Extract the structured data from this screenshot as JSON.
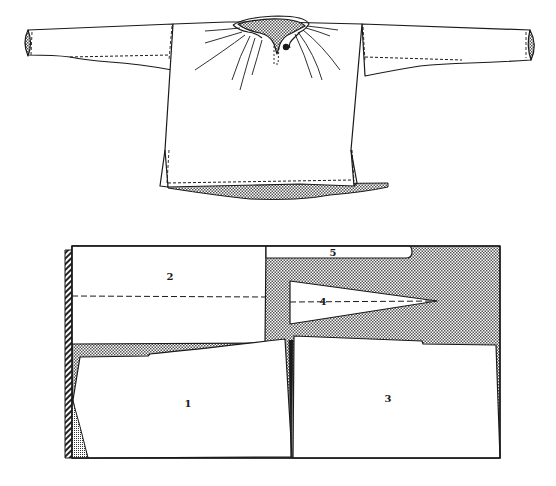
{
  "figure": {
    "type": "garment-pattern-illustration",
    "shirt_illustration": {
      "description": "Long-sleeved tunic shirt with gathered neckline and keyhole slit, side vents, dashed stitching lines",
      "features": [
        "gathered-neckline",
        "neck-slit",
        "button",
        "long-sleeves",
        "shaded-cuffs",
        "side-slits",
        "stitched-hem",
        "shaded-back-hem"
      ]
    },
    "cutting_layout": {
      "description": "Cutting layout of the shirt pieces on a folded length of cloth; shaded areas are waste",
      "pieces": [
        {
          "id": "1",
          "label": "1"
        },
        {
          "id": "2",
          "label": "2"
        },
        {
          "id": "3",
          "label": "3"
        },
        {
          "id": "4",
          "label": "4"
        },
        {
          "id": "5",
          "label": "5"
        }
      ]
    }
  },
  "colors": {
    "ink": "#1a1a1a",
    "paper": "#ffffff",
    "shade": "#b8b8b8"
  }
}
